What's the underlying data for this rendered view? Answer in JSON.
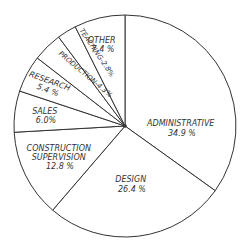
{
  "chart_data": {
    "type": "pie",
    "title": "",
    "start_angle": "12 o'clock",
    "direction": "clockwise",
    "categories": [
      "ADMINISTRATIVE",
      "DESIGN",
      "CONSTRUCTION SUPERVISION",
      "SALES",
      "RESEARCH",
      "PRODUCTION",
      "TEACHING",
      "OTHER"
    ],
    "values": [
      34.9,
      26.4,
      12.8,
      6.0,
      5.4,
      4.3,
      2.8,
      7.4
    ],
    "labels": [
      {
        "name": [
          "ADMINISTRATIVE"
        ],
        "value": "34.9 %"
      },
      {
        "name": [
          "DESIGN"
        ],
        "value": "26.4 %"
      },
      {
        "name": [
          "CONSTRUCTION",
          "SUPERVISION"
        ],
        "value": "12.8 %"
      },
      {
        "name": [
          "SALES"
        ],
        "value": "6.0%"
      },
      {
        "name": [
          "RESEARCH"
        ],
        "value": "5.4 %"
      },
      {
        "name": [
          "PRODUCTION-4.3%"
        ],
        "value": ""
      },
      {
        "name": [
          "TEACHING-2.8%"
        ],
        "value": ""
      },
      {
        "name": [
          "OTHER"
        ],
        "value": "7.4 %"
      }
    ],
    "colors": {
      "stroke": "#333333",
      "fill": "#ffffff",
      "text": "#333333"
    },
    "legend": "none"
  }
}
